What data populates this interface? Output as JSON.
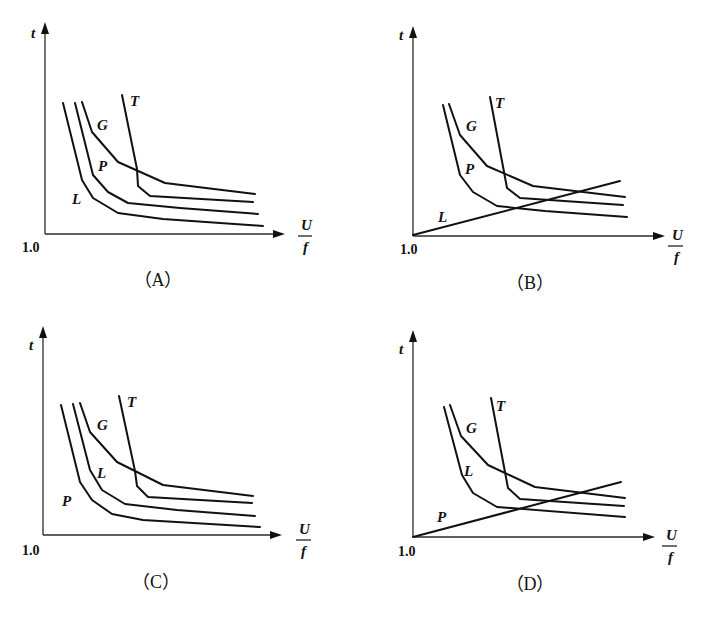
{
  "figure": {
    "panels": [
      {
        "id": "A",
        "caption": "（A）",
        "origin_label": "1.0",
        "y_label": "t",
        "x_label_num": "U",
        "x_label_den": "f",
        "axes": {
          "ox": 45,
          "oy": 234,
          "ytop": 22,
          "xright": 285
        },
        "labels": {
          "ylabel": [
            31,
            38
          ],
          "xnum": [
            301,
            230
          ],
          "xden": [
            303,
            252
          ],
          "frac": [
            298,
            312,
            236
          ],
          "origin": [
            22,
            252
          ],
          "caption": [
            158,
            286
          ]
        },
        "curves": [
          {
            "name": "L",
            "label_pos": [
              72,
              204
            ],
            "points": [
              [
                63,
                103
              ],
              [
                82,
                180
              ],
              [
                93,
                198
              ],
              [
                118,
                213
              ],
              [
                163,
                219
              ],
              [
                263,
                226
              ]
            ]
          },
          {
            "name": "P",
            "label_pos": [
              98,
              171
            ],
            "points": [
              [
                75,
                103
              ],
              [
                93,
                175
              ],
              [
                108,
                192
              ],
              [
                128,
                203
              ],
              [
                180,
                208
              ],
              [
                258,
                214
              ]
            ]
          },
          {
            "name": "G",
            "label_pos": [
              97,
              130
            ],
            "points": [
              [
                82,
                102
              ],
              [
                92,
                132
              ],
              [
                118,
                162
              ],
              [
                165,
                183
              ],
              [
                255,
                194
              ]
            ]
          },
          {
            "name": "T",
            "label_pos": [
              130,
              106
            ],
            "points": [
              [
                122,
                95
              ],
              [
                137,
                169
              ],
              [
                138,
                186
              ],
              [
                150,
                196
              ],
              [
                253,
                202
              ]
            ]
          }
        ]
      },
      {
        "id": "B",
        "caption": "（B）",
        "origin_label": "1.0",
        "y_label": "t",
        "x_label_num": "U",
        "x_label_den": "f",
        "axes": {
          "ox": 413,
          "oy": 236,
          "ytop": 26,
          "xright": 665
        },
        "labels": {
          "ylabel": [
            399,
            40
          ],
          "xnum": [
            672,
            240
          ],
          "xden": [
            674,
            262
          ],
          "frac": [
            668,
            683,
            246
          ],
          "origin": [
            400,
            254
          ],
          "caption": [
            530,
            289
          ]
        },
        "curves": [
          {
            "name": "L",
            "label_pos": [
              438,
              222
            ],
            "points": [
              [
                413,
                235
              ],
              [
                620,
                181
              ]
            ]
          },
          {
            "name": "P",
            "label_pos": [
              465,
              174
            ],
            "points": [
              [
                443,
                105
              ],
              [
                460,
                175
              ],
              [
                473,
                192
              ],
              [
                497,
                206
              ],
              [
                545,
                211
              ],
              [
                627,
                217
              ]
            ]
          },
          {
            "name": "G",
            "label_pos": [
              466,
              131
            ],
            "points": [
              [
                449,
                104
              ],
              [
                460,
                135
              ],
              [
                487,
                166
              ],
              [
                533,
                186
              ],
              [
                625,
                197
              ]
            ]
          },
          {
            "name": "T",
            "label_pos": [
              495,
              108
            ],
            "points": [
              [
                490,
                97
              ],
              [
                507,
                188
              ],
              [
                520,
                198
              ],
              [
                623,
                205
              ]
            ]
          }
        ]
      },
      {
        "id": "C",
        "caption": "（C）",
        "origin_label": "1.0",
        "y_label": "t",
        "x_label_num": "U",
        "x_label_den": "f",
        "axes": {
          "ox": 43,
          "oy": 535,
          "ytop": 326,
          "xright": 282
        },
        "labels": {
          "ylabel": [
            29,
            350
          ],
          "xnum": [
            299,
            534
          ],
          "xden": [
            301,
            556
          ],
          "frac": [
            296,
            311,
            540
          ],
          "origin": [
            22,
            555
          ],
          "caption": [
            156,
            588
          ]
        },
        "curves": [
          {
            "name": "P",
            "label_pos": [
              62,
              506
            ],
            "points": [
              [
                61,
                405
              ],
              [
                80,
                482
              ],
              [
                92,
                500
              ],
              [
                112,
                514
              ],
              [
                143,
                520
              ],
              [
                260,
                527
              ]
            ]
          },
          {
            "name": "L",
            "label_pos": [
              97,
              478
            ],
            "points": [
              [
                73,
                404
              ],
              [
                90,
                470
              ],
              [
                102,
                490
              ],
              [
                125,
                504
              ],
              [
                177,
                510
              ],
              [
                255,
                516
              ]
            ]
          },
          {
            "name": "G",
            "label_pos": [
              97,
              430
            ],
            "points": [
              [
                80,
                403
              ],
              [
                90,
                432
              ],
              [
                117,
                462
              ],
              [
                163,
                485
              ],
              [
                253,
                496
              ]
            ]
          },
          {
            "name": "T",
            "label_pos": [
              127,
              407
            ],
            "points": [
              [
                119,
                396
              ],
              [
                135,
                471
              ],
              [
                137,
                486
              ],
              [
                148,
                497
              ],
              [
                252,
                503
              ]
            ]
          }
        ]
      },
      {
        "id": "D",
        "caption": "（D）",
        "origin_label": "1.0",
        "y_label": "t",
        "x_label_num": "U",
        "x_label_den": "f",
        "axes": {
          "ox": 413,
          "oy": 537,
          "ytop": 330,
          "xright": 655
        },
        "labels": {
          "ylabel": [
            399,
            354
          ],
          "xnum": [
            666,
            540
          ],
          "xden": [
            668,
            562
          ],
          "frac": [
            662,
            677,
            546
          ],
          "origin": [
            398,
            556
          ],
          "caption": [
            530,
            590
          ]
        },
        "curves": [
          {
            "name": "P",
            "label_pos": [
              437,
              522
            ],
            "points": [
              [
                413,
                537
              ],
              [
                621,
                482
              ]
            ]
          },
          {
            "name": "L",
            "label_pos": [
              464,
              476
            ],
            "points": [
              [
                444,
                407
              ],
              [
                462,
                475
              ],
              [
                473,
                493
              ],
              [
                497,
                507
              ],
              [
                625,
                517
              ]
            ]
          },
          {
            "name": "G",
            "label_pos": [
              466,
              433
            ],
            "points": [
              [
                450,
                405
              ],
              [
                461,
                436
              ],
              [
                488,
                465
              ],
              [
                535,
                487
              ],
              [
                625,
                498
              ]
            ]
          },
          {
            "name": "T",
            "label_pos": [
              496,
              411
            ],
            "points": [
              [
                491,
                398
              ],
              [
                508,
                488
              ],
              [
                520,
                499
              ],
              [
                624,
                506
              ]
            ]
          }
        ]
      }
    ]
  },
  "chart_data": [
    {
      "type": "line",
      "title": "(A)",
      "xlabel": "U/f",
      "ylabel": "t",
      "x_origin": "1.0",
      "series": [
        {
          "name": "L",
          "shape": "hyperbolic decreasing (lowest)"
        },
        {
          "name": "P",
          "shape": "hyperbolic decreasing"
        },
        {
          "name": "G",
          "shape": "hyperbolic decreasing (upper)"
        },
        {
          "name": "T",
          "shape": "steep drop then flat"
        }
      ]
    },
    {
      "type": "line",
      "title": "(B)",
      "xlabel": "U/f",
      "ylabel": "t",
      "x_origin": "1.0",
      "series": [
        {
          "name": "L",
          "shape": "straight line rising from origin"
        },
        {
          "name": "P",
          "shape": "hyperbolic decreasing"
        },
        {
          "name": "G",
          "shape": "hyperbolic decreasing (upper)"
        },
        {
          "name": "T",
          "shape": "steep drop then flat"
        }
      ]
    },
    {
      "type": "line",
      "title": "(C)",
      "xlabel": "U/f",
      "ylabel": "t",
      "x_origin": "1.0",
      "series": [
        {
          "name": "P",
          "shape": "hyperbolic decreasing (lowest)"
        },
        {
          "name": "L",
          "shape": "hyperbolic decreasing"
        },
        {
          "name": "G",
          "shape": "hyperbolic decreasing (upper)"
        },
        {
          "name": "T",
          "shape": "steep drop then flat"
        }
      ]
    },
    {
      "type": "line",
      "title": "(D)",
      "xlabel": "U/f",
      "ylabel": "t",
      "x_origin": "1.0",
      "series": [
        {
          "name": "P",
          "shape": "straight line rising from origin"
        },
        {
          "name": "L",
          "shape": "hyperbolic decreasing"
        },
        {
          "name": "G",
          "shape": "hyperbolic decreasing (upper)"
        },
        {
          "name": "T",
          "shape": "steep drop then flat"
        }
      ]
    }
  ]
}
